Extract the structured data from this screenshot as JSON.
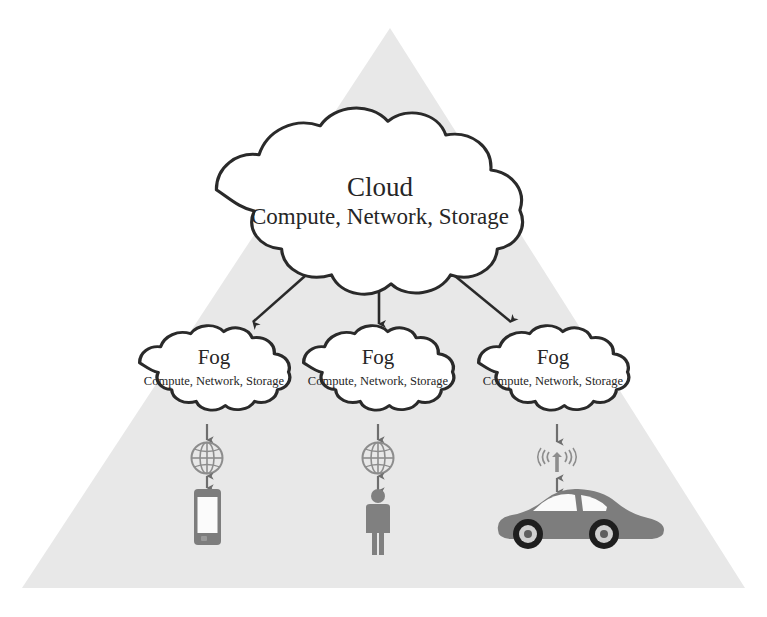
{
  "diagram": {
    "background_color": "#ffffff",
    "triangle_color": "#e8e8e8",
    "stroke_color": "#2a2a2a",
    "device_color": "#7d7d7d",
    "text_color": "#262626"
  },
  "cloud": {
    "label": "Cloud",
    "services": "Compute, Network, Storage"
  },
  "fog_nodes": [
    {
      "label": "Fog",
      "services": "Compute, Network, Storage"
    },
    {
      "label": "Fog",
      "services": "Compute, Network, Storage"
    },
    {
      "label": "Fog",
      "services": "Compute, Network, Storage"
    }
  ],
  "links": [
    {
      "from": "cloud",
      "to": "fog-left",
      "arrow": "single"
    },
    {
      "from": "cloud",
      "to": "fog-center",
      "arrow": "single"
    },
    {
      "from": "cloud",
      "to": "fog-right",
      "arrow": "single"
    }
  ],
  "access_points": [
    {
      "name": "globe-icon",
      "branch": "left"
    },
    {
      "name": "globe-icon",
      "branch": "center"
    },
    {
      "name": "cell-tower-icon",
      "branch": "right"
    }
  ],
  "end_devices": [
    {
      "name": "smartphone-icon",
      "branch": "left"
    },
    {
      "name": "person-icon",
      "branch": "center"
    },
    {
      "name": "car-icon",
      "branch": "right"
    }
  ]
}
